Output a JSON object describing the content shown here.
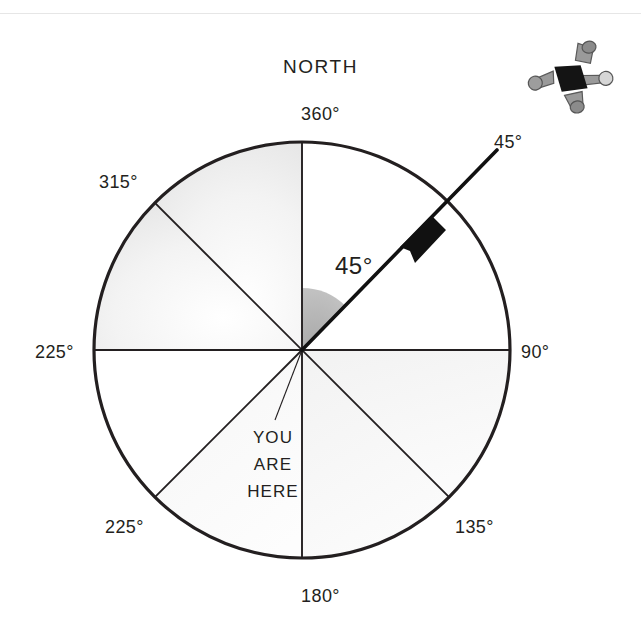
{
  "page": {
    "background_color": "#ffffff",
    "rule_color": "#e6e6e6",
    "ink_color": "#231f20"
  },
  "diagram": {
    "type": "compass-rose",
    "title": "NORTH",
    "center": {
      "x": 302,
      "y": 350
    },
    "radius": 208,
    "heading_label": "45°",
    "heading_degrees": 45,
    "you_are_here": {
      "line1": "YOU",
      "line2": "ARE",
      "line3": "HERE"
    },
    "shaded_wedge": {
      "from_degrees": 0,
      "to_degrees": 45,
      "color": "#b3b3b3",
      "radius": 62
    },
    "bearing_labels": [
      {
        "name": "bearing-360",
        "text": "360°",
        "degrees": 360,
        "position": "top"
      },
      {
        "name": "bearing-45",
        "text": "45°",
        "degrees": 45,
        "position": "top-right"
      },
      {
        "name": "bearing-90",
        "text": "90°",
        "degrees": 90,
        "position": "right"
      },
      {
        "name": "bearing-135",
        "text": "135°",
        "degrees": 135,
        "position": "bottom-right"
      },
      {
        "name": "bearing-180",
        "text": "180°",
        "degrees": 180,
        "position": "bottom"
      },
      {
        "name": "bearing-225-sw",
        "text": "225°",
        "degrees": 225,
        "position": "bottom-left"
      },
      {
        "name": "bearing-225-w",
        "text": "225°",
        "degrees": 270,
        "position": "left"
      },
      {
        "name": "bearing-315",
        "text": "315°",
        "degrees": 315,
        "position": "top-left"
      }
    ],
    "skydiver": {
      "name": "skydiver-figure",
      "suit_color": "#8d8d8d",
      "body_color": "#1a1a1a",
      "shadow_color": "#c9c9c9"
    }
  }
}
